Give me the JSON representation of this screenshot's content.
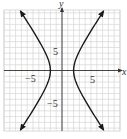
{
  "chart_data": {
    "type": "line",
    "title": "",
    "equation_implied": "x^2/4 - y^2/9 = 1",
    "xlabel": "x",
    "ylabel": "y",
    "xlim": [
      -10,
      10
    ],
    "ylim": [
      -10.5,
      10.5
    ],
    "grid": true,
    "grid_step": 1,
    "tick_labels": {
      "x": [
        {
          "value": -5,
          "label": "-5"
        },
        {
          "value": 5,
          "label": "5"
        }
      ],
      "y": [
        {
          "value": 5,
          "label": "5"
        },
        {
          "value": -5,
          "label": "-5"
        }
      ]
    },
    "series": [
      {
        "name": "right branch",
        "vertex": [
          2,
          0
        ],
        "a": 2,
        "b": 3,
        "branch": "right",
        "arrows": true
      },
      {
        "name": "left branch",
        "vertex": [
          -2,
          0
        ],
        "a": 2,
        "b": 3,
        "branch": "left",
        "arrows": true
      }
    ],
    "legend": null
  },
  "labels": {
    "x_axis": "x",
    "y_axis": "y",
    "x_pos5": "5",
    "x_neg5": "−5",
    "y_pos5": "5",
    "y_neg5": "−5"
  },
  "colors": {
    "grid": "#cfcfcf",
    "axis": "#444444",
    "curve": "#1a1a1a"
  }
}
